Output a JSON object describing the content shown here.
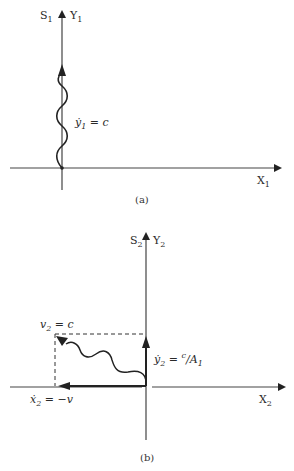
{
  "diagram_a": {
    "caption": "(a)",
    "axis_s": "S",
    "axis_s_sub": "1",
    "axis_y": "Y",
    "axis_y_sub": "1",
    "axis_x": "X",
    "axis_x_sub": "1",
    "velocity_label": "ẏ",
    "velocity_sub": "1",
    "velocity_eq": " =  c"
  },
  "diagram_b": {
    "caption": "(b)",
    "axis_s": "S",
    "axis_s_sub": "2",
    "axis_y": "Y",
    "axis_y_sub": "2",
    "axis_x": "X",
    "axis_x_sub": "2",
    "v_label": "v",
    "v_sub": "2",
    "v_eq": " = c",
    "ydot_label": "ẏ",
    "ydot_sub": "2",
    "ydot_eq": " = ",
    "ydot_num": "c",
    "ydot_den": "A",
    "ydot_den_sub": "1",
    "xdot_label": "ẋ",
    "xdot_sub": "2",
    "xdot_eq": " = −v"
  }
}
